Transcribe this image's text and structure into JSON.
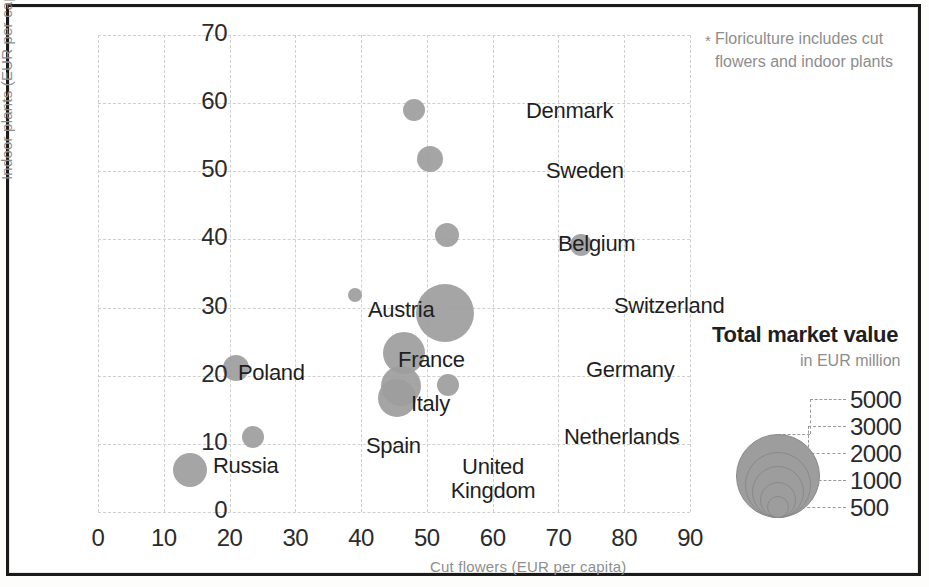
{
  "footnote": {
    "marker": "*",
    "text": "Floriculture includes cut flowers and indoor plants"
  },
  "legend": {
    "title": "Total market value",
    "subtitle": "in EUR million",
    "entries": [
      {
        "label": "5000",
        "radius_px": 42
      },
      {
        "label": "3000",
        "radius_px": 33
      },
      {
        "label": "2000",
        "radius_px": 26
      },
      {
        "label": "1000",
        "radius_px": 18
      },
      {
        "label": "500",
        "radius_px": 11
      }
    ]
  },
  "chart_data": {
    "type": "scatter",
    "title": "",
    "xlabel": "Cut flowers (EUR per capita)",
    "ylabel": "Indoor plants (EUR per capita)",
    "xlim": [
      0,
      90
    ],
    "ylim": [
      0,
      70
    ],
    "xticks": [
      0,
      10,
      20,
      30,
      40,
      50,
      60,
      70,
      80,
      90
    ],
    "yticks": [
      0,
      10,
      20,
      30,
      40,
      50,
      60,
      70
    ],
    "grid": true,
    "legend_position": "right",
    "size_units": "EUR million (total market value)",
    "points": [
      {
        "label": "Denmark",
        "x": 48.0,
        "y": 59.0,
        "r_px": 11,
        "size": 600
      },
      {
        "label": "Sweden",
        "x": 50.5,
        "y": 51.8,
        "r_px": 13,
        "size": 900
      },
      {
        "label": "Belgium",
        "x": 53.0,
        "y": 40.6,
        "r_px": 12,
        "size": 800
      },
      {
        "label": "Switzerland",
        "x": 73.5,
        "y": 39.2,
        "r_px": 11,
        "size": 650
      },
      {
        "label": "Austria",
        "x": 39.0,
        "y": 31.8,
        "r_px": 7,
        "size": 300
      },
      {
        "label": "Germany",
        "x": 52.7,
        "y": 29.2,
        "r_px": 29,
        "size": 5000
      },
      {
        "label": "France",
        "x": 46.5,
        "y": 23.4,
        "r_px": 21,
        "size": 2800
      },
      {
        "label": "Poland",
        "x": 21.0,
        "y": 21.2,
        "r_px": 13,
        "size": 900
      },
      {
        "label": "Netherlands",
        "x": 53.2,
        "y": 18.6,
        "r_px": 11,
        "size": 650
      },
      {
        "label": "Italy",
        "x": 46.0,
        "y": 18.5,
        "r_px": 20,
        "size": 2500
      },
      {
        "label": "United Kingdom",
        "x": 45.4,
        "y": 16.8,
        "r_px": 19,
        "size": 2300
      },
      {
        "label": "Spain",
        "x": 23.5,
        "y": 11.0,
        "r_px": 11,
        "size": 650
      },
      {
        "label": "Russia",
        "x": 14.0,
        "y": 6.2,
        "r_px": 17,
        "size": 1600
      }
    ],
    "point_labels": [
      {
        "label": "Denmark",
        "left": 428,
        "top": 63,
        "align": "left"
      },
      {
        "label": "Sweden",
        "left": 448,
        "top": 123,
        "align": "left"
      },
      {
        "label": "Belgium",
        "left": 460,
        "top": 196,
        "align": "left"
      },
      {
        "label": "Switzerland",
        "left": 516,
        "top": 258,
        "align": "left"
      },
      {
        "label": "Austria",
        "left": 270,
        "top": 262,
        "align": "left"
      },
      {
        "label": "Germany",
        "left": 488,
        "top": 322,
        "align": "left"
      },
      {
        "label": "France",
        "left": 300,
        "top": 312,
        "align": "left"
      },
      {
        "label": "Poland",
        "left": 140,
        "top": 325,
        "align": "left"
      },
      {
        "label": "Netherlands",
        "left": 466,
        "top": 389,
        "align": "left"
      },
      {
        "label": "Italy",
        "left": 313,
        "top": 356,
        "align": "left"
      },
      {
        "label": "United Kingdom",
        "left": 370,
        "top": 420,
        "align": "center"
      },
      {
        "label": "Spain",
        "left": 268,
        "top": 398,
        "align": "left"
      },
      {
        "label": "Russia",
        "left": 115,
        "top": 418,
        "align": "left"
      }
    ]
  }
}
